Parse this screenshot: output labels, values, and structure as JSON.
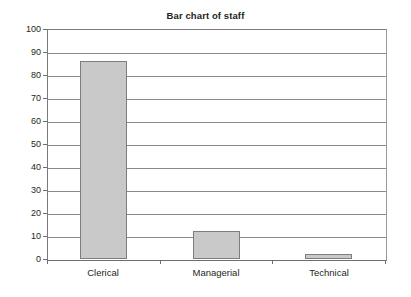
{
  "chart_data": {
    "type": "bar",
    "title": "Bar chart of staff",
    "xlabel": "",
    "ylabel": "",
    "categories": [
      "Clerical",
      "Managerial",
      "Technical"
    ],
    "values": [
      86,
      12,
      2
    ],
    "ylim": [
      0,
      100
    ],
    "y_ticks": [
      0,
      10,
      20,
      30,
      40,
      50,
      60,
      70,
      80,
      90,
      100
    ],
    "y_tick_labels": [
      "0",
      "10",
      "20",
      "30",
      "40",
      "50",
      "60",
      "70",
      "80",
      "90",
      "100"
    ],
    "grid": true,
    "grid_axis": "y",
    "legend": false,
    "legend_position": "none",
    "series": [
      {
        "name": "staff",
        "values": [
          86,
          12,
          2
        ]
      }
    ],
    "colors": {
      "bar_fill": "#c9c9c9",
      "bar_border": "#7d7d7d",
      "gridline": "#8a8a8a",
      "axis": "#6e6e6e",
      "text": "#231f20",
      "background": "#ffffff"
    }
  }
}
